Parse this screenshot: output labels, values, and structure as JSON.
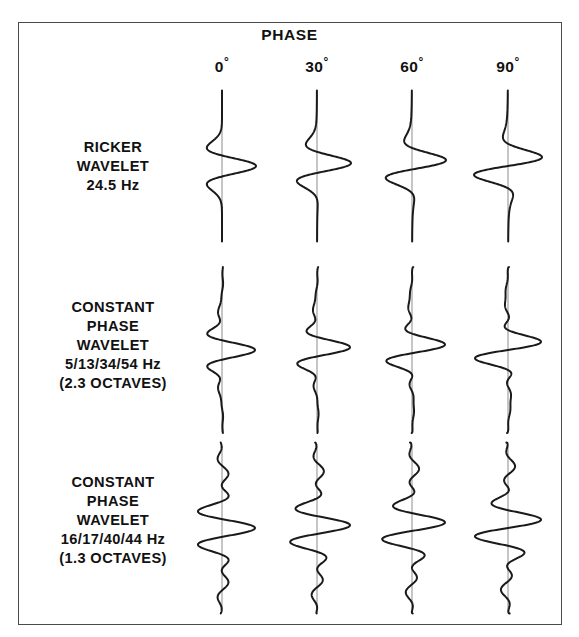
{
  "figure": {
    "title": "PHASE",
    "border_color": "#4a4a4a",
    "trace_color": "#1a1a1a",
    "axis_color": "#8d8d8d",
    "background": "#ffffff"
  },
  "columns": [
    {
      "label": "0",
      "degree_symbol": "°",
      "phase_deg": 0,
      "center_x": 222
    },
    {
      "label": "30",
      "degree_symbol": "°",
      "phase_deg": 30,
      "center_x": 317
    },
    {
      "label": "60",
      "degree_symbol": "°",
      "phase_deg": 60,
      "center_x": 412
    },
    {
      "label": "90",
      "degree_symbol": "°",
      "phase_deg": 90,
      "center_x": 508
    }
  ],
  "rows": [
    {
      "name": "ricker-wavelet",
      "lines": [
        "RICKER",
        "WAVELET",
        "24.5 Hz"
      ],
      "label_top": 138,
      "center_y": 166,
      "trace_top": 92,
      "trace_bottom": 243,
      "wavelet_type": "ricker",
      "dominant_frequency_hz": 24.5,
      "amplitude_px": 34,
      "time_half_window_s": 0.066
    },
    {
      "name": "constant-phase-wavelet-2-3-octaves",
      "lines": [
        "CONSTANT",
        "PHASE",
        "WAVELET",
        "5/13/34/54 Hz",
        "(2.3 OCTAVES)"
      ],
      "label_top": 298,
      "center_y": 350,
      "trace_top": 268,
      "trace_bottom": 434,
      "wavelet_type": "ormsby",
      "corner_frequencies_hz": [
        5,
        13,
        34,
        54
      ],
      "octaves": 2.3,
      "amplitude_px": 33,
      "time_half_window_s": 0.08
    },
    {
      "name": "constant-phase-wavelet-1-3-octaves",
      "lines": [
        "CONSTANT",
        "PHASE",
        "WAVELET",
        "16/17/40/44 Hz",
        "(1.3 OCTAVES)"
      ],
      "label_top": 473,
      "center_y": 528,
      "trace_top": 444,
      "trace_bottom": 615,
      "wavelet_type": "ormsby",
      "corner_frequencies_hz": [
        16,
        17,
        40,
        44
      ],
      "octaves": 1.3,
      "amplitude_px": 33,
      "time_half_window_s": 0.082
    }
  ],
  "chart_data": {
    "type": "line",
    "title": "PHASE",
    "xlabel": "",
    "ylabel": "",
    "grid": false,
    "legend": "none",
    "column_categories": [
      "0°",
      "30°",
      "60°",
      "90°"
    ],
    "row_categories": [
      "RICKER WAVELET 24.5 Hz",
      "CONSTANT PHASE WAVELET 5/13/34/54 Hz (2.3 OCTAVES)",
      "CONSTANT PHASE WAVELET 16/17/40/44 Hz (1.3 OCTAVES)"
    ],
    "series": [
      {
        "name": "RICKER WAVELET 24.5 Hz",
        "wavelet": "ricker",
        "peak_frequency_hz": 24.5,
        "phases_deg": [
          0,
          30,
          60,
          90
        ]
      },
      {
        "name": "CONSTANT PHASE WAVELET 5/13/34/54 Hz",
        "wavelet": "ormsby",
        "corner_frequencies_hz": [
          5,
          13,
          34,
          54
        ],
        "bandwidth_octaves": 2.3,
        "phases_deg": [
          0,
          30,
          60,
          90
        ]
      },
      {
        "name": "CONSTANT PHASE WAVELET 16/17/40/44 Hz",
        "wavelet": "ormsby",
        "corner_frequencies_hz": [
          16,
          17,
          40,
          44
        ],
        "bandwidth_octaves": 1.3,
        "phases_deg": [
          0,
          30,
          60,
          90
        ]
      }
    ]
  }
}
